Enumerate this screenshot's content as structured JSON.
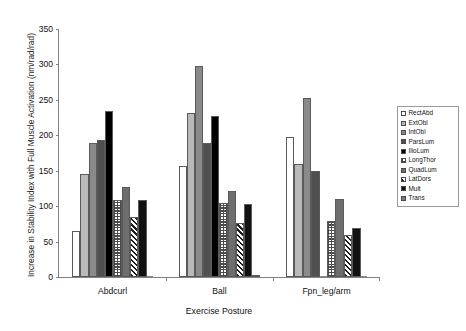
{
  "chart_data": {
    "type": "bar",
    "title": "",
    "xlabel": "Exercise Posture",
    "ylabel": "Increase in Stability Index with Full Muscle Activation (nm/rad/rad)",
    "categories": [
      "Abdcurl",
      "Ball",
      "Fpn_leg/arm"
    ],
    "ylim": [
      0,
      350
    ],
    "yticks": [
      0,
      50,
      100,
      150,
      200,
      250,
      300,
      350
    ],
    "ytick_labels": [
      "0",
      "50",
      "100",
      "150",
      "200",
      "250",
      "300",
      "350"
    ],
    "grid": false,
    "legend_position": "right",
    "series": [
      {
        "name": "RectAbd",
        "fill": "f0",
        "values": [
          65,
          157,
          197
        ]
      },
      {
        "name": "ExtObl",
        "fill": "f1",
        "values": [
          145,
          232,
          159
        ]
      },
      {
        "name": "IntObl",
        "fill": "f2",
        "values": [
          189,
          298,
          253
        ]
      },
      {
        "name": "ParsLum",
        "fill": "f3",
        "values": [
          193,
          189,
          150
        ]
      },
      {
        "name": "IlioLum",
        "fill": "f4",
        "values": [
          234,
          227,
          0
        ]
      },
      {
        "name": "LongThor",
        "fill": "f5",
        "values": [
          108,
          104,
          79
        ]
      },
      {
        "name": "QuadLum",
        "fill": "f6",
        "values": [
          127,
          122,
          110
        ]
      },
      {
        "name": "LatDors",
        "fill": "f7",
        "values": [
          85,
          76,
          60
        ]
      },
      {
        "name": "Mult",
        "fill": "f8",
        "values": [
          108,
          103,
          69
        ]
      },
      {
        "name": "Trans",
        "fill": "f9",
        "values": [
          0,
          3,
          0
        ]
      }
    ],
    "colors": {
      "axis": "#808080",
      "text": "#111111",
      "plot_background": "#ffffff"
    }
  }
}
